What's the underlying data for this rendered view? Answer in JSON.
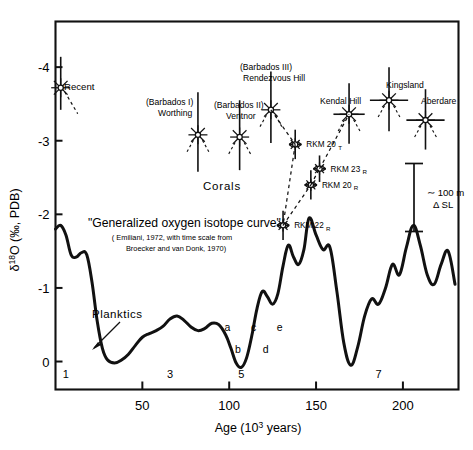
{
  "figure": {
    "title": "",
    "axis": {
      "y_label_delta": "δ",
      "y_label_sup": "18",
      "y_label_rest": "O (‰, PDB)",
      "y_label_full": "δ¹⁸O (‰, PDB)",
      "x_label_main": "Age (10",
      "x_label_sup": "3",
      "x_label_tail": " years)",
      "x_label_full": "Age (10³ years)",
      "y_ticks": [
        "-4",
        "-3",
        "-2",
        "-1",
        "0"
      ],
      "y_tick_values": [
        -4,
        -3,
        -2,
        -1,
        0
      ],
      "x_ticks": [
        "50",
        "100",
        "150",
        "200"
      ],
      "x_tick_values": [
        50,
        100,
        150,
        200
      ],
      "xlim": [
        0,
        232
      ],
      "ylim": [
        -4.62,
        0.38
      ]
    },
    "annotations": {
      "recent": "Recent",
      "corals": "Corals",
      "planktics": "Planktics",
      "curve_title": "\"Generalized oxygen isotope curve\"",
      "cite_line1": "( Emiliani, 1972, with time scale from",
      "cite_line2": "Broecker and  van Donk, 1970)",
      "scalebar_line1": "∼ 100 m",
      "scalebar_line2": "Δ SL"
    },
    "coral_labels": [
      {
        "line1": "(Barbados I)",
        "line2": "Worthing"
      },
      {
        "line1": "(Barbados II)",
        "line2": "Ventnor"
      },
      {
        "line1": "(Barbados III)",
        "line2": "Rendezvous Hill"
      },
      {
        "line1": "",
        "line2": "Kendal Hill"
      },
      {
        "line1": "",
        "line2": "Kingsland"
      },
      {
        "line1": "",
        "line2": "Aberdare"
      }
    ],
    "rkm_labels": [
      {
        "name": "RKM 20",
        "sub": "T"
      },
      {
        "name": "RKM 23",
        "sub": "R"
      },
      {
        "name": "RKM 20",
        "sub": "R"
      },
      {
        "name": "RKM 22",
        "sub": "R"
      }
    ],
    "stage_labels": [
      "1",
      "3",
      "5",
      "7"
    ],
    "substage_labels": [
      "a",
      "b",
      "c",
      "d",
      "e"
    ]
  },
  "chart_data": {
    "type": "line",
    "xlabel": "Age (10³ years)",
    "ylabel": "δ¹⁸O (‰, PDB)",
    "xlim": [
      0,
      232
    ],
    "ylim": [
      0.38,
      -4.62
    ],
    "y_inverted": true,
    "grid": false,
    "legend": null,
    "series": [
      {
        "name": "Generalized oxygen isotope curve (Planktics)",
        "style": "solid-thick",
        "x": [
          0,
          3,
          6,
          9,
          12,
          15,
          18,
          21,
          24,
          27,
          30,
          34,
          38,
          42,
          46,
          50,
          54,
          58,
          62,
          66,
          70,
          74,
          78,
          82,
          86,
          90,
          94,
          98,
          101,
          104,
          107,
          110,
          113,
          116,
          119,
          122,
          125,
          128,
          131,
          134,
          137,
          140,
          143,
          146,
          150,
          154,
          158,
          162,
          166,
          170,
          174,
          178,
          182,
          186,
          190,
          194,
          198,
          202,
          206,
          210,
          214,
          218,
          222,
          226,
          230
        ],
        "y": [
          -1.8,
          -1.85,
          -1.72,
          -1.45,
          -1.42,
          -1.48,
          -1.45,
          -1.08,
          -0.55,
          -0.18,
          -0.02,
          0.02,
          -0.02,
          -0.1,
          -0.22,
          -0.33,
          -0.38,
          -0.42,
          -0.48,
          -0.58,
          -0.62,
          -0.56,
          -0.47,
          -0.42,
          -0.45,
          -0.52,
          -0.5,
          -0.36,
          -0.18,
          0.02,
          0.08,
          -0.05,
          -0.35,
          -0.72,
          -0.95,
          -0.88,
          -0.78,
          -0.92,
          -1.3,
          -1.58,
          -1.42,
          -1.32,
          -1.52,
          -1.95,
          -1.72,
          -1.52,
          -1.55,
          -0.95,
          -0.25,
          0.05,
          -0.2,
          -0.62,
          -0.85,
          -0.78,
          -1.0,
          -1.32,
          -1.18,
          -1.55,
          -1.85,
          -1.58,
          -1.18,
          -1.05,
          -1.32,
          -1.5,
          -1.05
        ]
      }
    ],
    "coral_points": [
      {
        "label": "Recent",
        "x": 3.0,
        "y": -3.72,
        "yerr_up": 0.42,
        "yerr_down": 0.3,
        "xerr": 0
      },
      {
        "label": "(Barbados I) Worthing",
        "x": 82.0,
        "y": -3.08,
        "yerr_up": 0.58,
        "yerr_down": 0.5,
        "xerr": 0
      },
      {
        "label": "(Barbados II) Ventnor",
        "x": 106.0,
        "y": -3.05,
        "yerr_up": 0.5,
        "yerr_down": 0.45,
        "xerr": 0
      },
      {
        "label": "(Barbados III) Rendezvous Hill",
        "x": 124.0,
        "y": -3.42,
        "yerr_up": 0.52,
        "yerr_down": 0.45,
        "xerr": 0
      },
      {
        "label": "RKM 20 T",
        "x": 138.0,
        "y": -2.95,
        "yerr_up": 0.2,
        "yerr_down": 0.2,
        "xerr": 3.5
      },
      {
        "label": "RKM 23 R",
        "x": 152.0,
        "y": -2.62,
        "yerr_up": 0.18,
        "yerr_down": 0.18,
        "xerr": 3.5
      },
      {
        "label": "RKM 20 R",
        "x": 147.0,
        "y": -2.4,
        "yerr_up": 0.2,
        "yerr_down": 0.2,
        "xerr": 3.5
      },
      {
        "label": "RKM 22 R",
        "x": 131.0,
        "y": -1.85,
        "yerr_up": 0.2,
        "yerr_down": 0.2,
        "xerr": 3.5
      },
      {
        "label": "Kendal Hill",
        "x": 169.0,
        "y": -3.36,
        "yerr_up": 0.42,
        "yerr_down": 0.4,
        "xerr": 9.0
      },
      {
        "label": "Kingsland",
        "x": 192.0,
        "y": -3.55,
        "yerr_up": 0.45,
        "yerr_down": 0.42,
        "xerr": 11.0
      },
      {
        "label": "Aberdare",
        "x": 213.0,
        "y": -3.28,
        "yerr_up": 0.42,
        "yerr_down": 0.4,
        "xerr": 11.0
      }
    ],
    "scalebar": {
      "text": "∼ 100 m ΔSL",
      "y_top": -2.62,
      "y_bottom": -1.55,
      "x": 206
    },
    "stage_markers": [
      {
        "label": "1",
        "x": 6
      },
      {
        "label": "3",
        "x": 66
      },
      {
        "label": "5",
        "x": 107
      },
      {
        "label": "7",
        "x": 186
      }
    ],
    "substage_markers": [
      {
        "label": "a",
        "x": 99
      },
      {
        "label": "b",
        "x": 105
      },
      {
        "label": "c",
        "x": 114
      },
      {
        "label": "d",
        "x": 121
      },
      {
        "label": "e",
        "x": 129
      }
    ]
  }
}
